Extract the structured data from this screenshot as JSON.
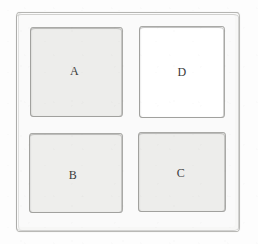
{
  "diagram": {
    "type": "2x2-grid-of-labeled-squares",
    "style": "hand-drawn-sketch",
    "colors": {
      "paper": "#fdfdfd",
      "frame_fill": "#f7f7f6",
      "frame_stroke": "#b9b9b6",
      "cell_stroke": "#a9a9a6",
      "cell_fill_grey": "#ededeb",
      "cell_fill_white": "#ffffff",
      "label_text": "#3b3b3b"
    },
    "frame": {
      "name": "outer-border"
    },
    "cells": [
      {
        "id": "a",
        "label": "A",
        "position": "top-left",
        "fill": "#ededeb",
        "shade": "grey"
      },
      {
        "id": "d",
        "label": "D",
        "position": "top-right",
        "fill": "#ffffff",
        "shade": "white"
      },
      {
        "id": "b",
        "label": "B",
        "position": "bottom-left",
        "fill": "#eeeeec",
        "shade": "grey"
      },
      {
        "id": "c",
        "label": "C",
        "position": "bottom-right",
        "fill": "#ededeb",
        "shade": "grey"
      }
    ]
  }
}
